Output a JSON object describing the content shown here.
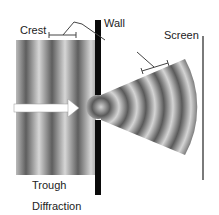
{
  "diagram": {
    "title": "Diffraction",
    "labels": {
      "crest": "Crest",
      "wall": "Wall",
      "screen": "Screen",
      "trough": "Trough",
      "caption": "Diffraction"
    },
    "colors": {
      "wall": "#0a0a0a",
      "screen": "#7a7a7a",
      "wave_dark": "#5a5a5a",
      "wave_light": "#d8d8d8",
      "arrow": "#ffffff",
      "leader": "#444444"
    }
  }
}
